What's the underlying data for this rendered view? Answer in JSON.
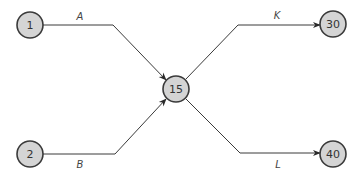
{
  "diagram": {
    "type": "activity-network",
    "colors": {
      "node_fill": "#d4d4d4",
      "node_stroke": "#3a3a3a",
      "edge": "#3a3a3a"
    },
    "nodes": [
      {
        "id": "n1",
        "label": "1",
        "cx": 30,
        "cy": 25
      },
      {
        "id": "n2",
        "label": "2",
        "cx": 30,
        "cy": 154
      },
      {
        "id": "n15",
        "label": "15",
        "cx": 176,
        "cy": 89
      },
      {
        "id": "n30",
        "label": "30",
        "cx": 333,
        "cy": 24
      },
      {
        "id": "n40",
        "label": "40",
        "cx": 333,
        "cy": 154
      }
    ],
    "edges": [
      {
        "id": "eA",
        "label": "A",
        "from": "1",
        "to": "15",
        "label_x": 80,
        "label_y": 19
      },
      {
        "id": "eB",
        "label": "B",
        "from": "2",
        "to": "15",
        "label_x": 80,
        "label_y": 167
      },
      {
        "id": "eK",
        "label": "K",
        "from": "15",
        "to": "30",
        "label_x": 277,
        "label_y": 18
      },
      {
        "id": "eL",
        "label": "L",
        "from": "15",
        "to": "40",
        "label_x": 278,
        "label_y": 167
      }
    ]
  }
}
